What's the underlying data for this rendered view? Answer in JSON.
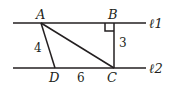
{
  "diagram": {
    "lines": [
      {
        "name": "l1",
        "label": "ℓ1"
      },
      {
        "name": "l2",
        "label": "ℓ2"
      }
    ],
    "points": {
      "A": "A",
      "B": "B",
      "C": "C",
      "D": "D"
    },
    "measures": {
      "AD": "4",
      "BC": "3",
      "DC": "6"
    },
    "right_angle_at": "B",
    "colors": {
      "stroke": "#231f20",
      "background": "#ffffff"
    }
  }
}
